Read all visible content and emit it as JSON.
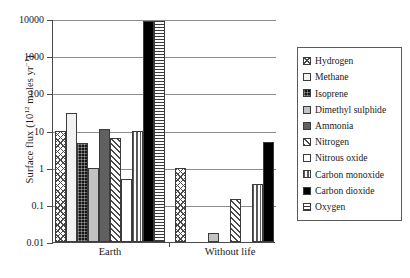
{
  "chart_data": {
    "type": "bar",
    "title": "",
    "xlabel": "",
    "ylabel": "Surface flux (10^12 moles yr^-1)",
    "ylabel_prefix": "Surface flux (10",
    "ylabel_exp1": "12",
    "ylabel_mid": " moles yr",
    "ylabel_exp2": "−1",
    "ylabel_suffix": ")",
    "yscale": "log",
    "ylim": [
      0.01,
      10000
    ],
    "yticks": [
      "10000",
      "1000",
      "100",
      "10",
      "1",
      "0.1",
      "0.01"
    ],
    "ytick_values": [
      10000,
      1000,
      100,
      10,
      1,
      0.1,
      0.01
    ],
    "grid": true,
    "legend_position": "right-outside",
    "categories": [
      "Earth",
      "Without life"
    ],
    "series": [
      {
        "name": "Hydrogen",
        "pattern": "diagonal-crosshatch",
        "values": [
          10,
          1
        ]
      },
      {
        "name": "Methane",
        "pattern": "solid-white",
        "values": [
          30,
          null
        ]
      },
      {
        "name": "Isoprene",
        "pattern": "black-dotted",
        "values": [
          4.5,
          null
        ]
      },
      {
        "name": "Dimethyl sulphide",
        "pattern": "light-grey",
        "values": [
          1,
          0.017
        ]
      },
      {
        "name": "Ammonia",
        "pattern": "dark-grey",
        "values": [
          11,
          null
        ]
      },
      {
        "name": "Nitrogen",
        "pattern": "diagonal-hatch",
        "values": [
          6.3,
          0.14
        ]
      },
      {
        "name": "Nitrous oxide",
        "pattern": "white",
        "values": [
          0.5,
          null
        ]
      },
      {
        "name": "Carbon monoxide",
        "pattern": "vertical-lines",
        "values": [
          10,
          0.37
        ]
      },
      {
        "name": "Carbon dioxide",
        "pattern": "solid-black",
        "values": [
          9000,
          5
        ]
      },
      {
        "name": "Oxygen",
        "pattern": "horizontal-lines",
        "values": [
          9000,
          null
        ]
      }
    ]
  },
  "legend": {
    "items": [
      {
        "label": "Hydrogen"
      },
      {
        "label": "Methane"
      },
      {
        "label": "Isoprene"
      },
      {
        "label": "Dimethyl sulphide"
      },
      {
        "label": "Ammonia"
      },
      {
        "label": "Nitrogen"
      },
      {
        "label": "Nitrous oxide"
      },
      {
        "label": "Carbon monoxide"
      },
      {
        "label": "Carbon dioxide"
      },
      {
        "label": "Oxygen"
      }
    ]
  },
  "colors": {
    "axis": "#4a4a4a",
    "grid": "#8d8d8d",
    "bar_outline": "#3b3b3b",
    "black": "#000000",
    "dark_grey": "#606060",
    "light_grey": "#c2c2c2",
    "near_white": "#f2f2f2",
    "background": "#ffffff"
  }
}
